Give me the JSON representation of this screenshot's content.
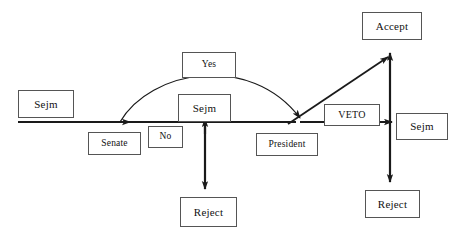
{
  "diagram": {
    "canvas": {
      "width": 461,
      "height": 242
    },
    "stroke_color": "#1a1a1a",
    "box_border_color": "#555555",
    "box_fill_color": "#ffffff",
    "text_color": "#111111",
    "nodes": [
      {
        "id": "sejm-start",
        "label": "Sejm",
        "x": 18,
        "y": 90,
        "w": 56,
        "h": 28
      },
      {
        "id": "senate",
        "label": "Senate",
        "x": 88,
        "y": 132,
        "w": 53,
        "h": 23
      },
      {
        "id": "no",
        "label": "No",
        "x": 148,
        "y": 126,
        "w": 35,
        "h": 22
      },
      {
        "id": "yes",
        "label": "Yes",
        "x": 182,
        "y": 52,
        "w": 54,
        "h": 26
      },
      {
        "id": "sejm-middle",
        "label": "Sejm",
        "x": 178,
        "y": 94,
        "w": 53,
        "h": 28
      },
      {
        "id": "reject-left",
        "label": "Reject",
        "x": 180,
        "y": 197,
        "w": 57,
        "h": 30
      },
      {
        "id": "president",
        "label": "President",
        "x": 256,
        "y": 133,
        "w": 62,
        "h": 23
      },
      {
        "id": "veto",
        "label": "VETO",
        "x": 324,
        "y": 104,
        "w": 56,
        "h": 22
      },
      {
        "id": "accept",
        "label": "Accept",
        "x": 362,
        "y": 12,
        "w": 60,
        "h": 28
      },
      {
        "id": "sejm-end",
        "label": "Sejm",
        "x": 396,
        "y": 113,
        "w": 52,
        "h": 27
      },
      {
        "id": "reject-right",
        "label": "Reject",
        "x": 365,
        "y": 190,
        "w": 55,
        "h": 28
      }
    ],
    "edges": [
      {
        "id": "sejm-start-to-senate",
        "from": "sejm-start",
        "to": "senate",
        "kind": "horizontal-arrow"
      },
      {
        "id": "senate-no-to-sejm",
        "from": "senate",
        "to": "sejm-middle",
        "kind": "horizontal"
      },
      {
        "id": "senate-yes-curve",
        "from": "senate",
        "to": "president",
        "kind": "curve",
        "label": "Yes"
      },
      {
        "id": "sejm-middle-to-reject",
        "from": "sejm-middle",
        "to": "reject-left",
        "kind": "vertical-down-arrow"
      },
      {
        "id": "sejm-middle-up",
        "from": "reject-left",
        "to": "sejm-middle",
        "kind": "vertical-up-arrow"
      },
      {
        "id": "president-to-accept",
        "from": "president",
        "to": "accept",
        "kind": "diagonal-arrow"
      },
      {
        "id": "president-veto-to-sejm",
        "from": "president",
        "to": "sejm-end",
        "kind": "horizontal-arrow",
        "label": "VETO"
      },
      {
        "id": "sejm-end-to-accept",
        "from": "sejm-end",
        "to": "accept",
        "kind": "vertical-up-arrow"
      },
      {
        "id": "sejm-end-to-reject",
        "from": "sejm-end",
        "to": "reject-right",
        "kind": "vertical-down-arrow"
      }
    ]
  }
}
